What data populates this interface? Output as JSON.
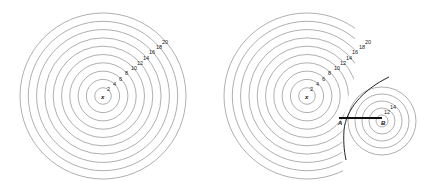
{
  "left_figure": {
    "center_label": "x",
    "ring_labels": [
      "2",
      "4",
      "6",
      "8",
      "10",
      "12",
      "14",
      "16",
      "18",
      "20"
    ]
  },
  "right_figure": {
    "center_label": "x",
    "ring_labels": [
      "2",
      "4",
      "6",
      "8",
      "10",
      "12",
      "14",
      "16",
      "18",
      "20"
    ],
    "point_a_label": "A",
    "point_b_label": "B",
    "b_ring_labels": [
      "12",
      "14"
    ]
  }
}
